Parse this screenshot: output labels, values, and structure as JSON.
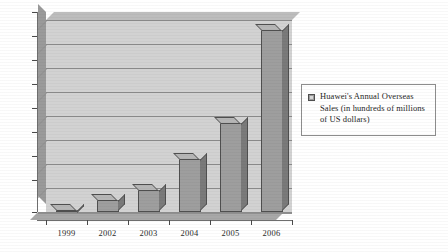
{
  "chart_data": {
    "type": "bar",
    "title": "",
    "xlabel": "",
    "ylabel": "",
    "categories": [
      "1999",
      "2002",
      "2003",
      "2004",
      "2005",
      "2006"
    ],
    "values": [
      1,
      5,
      9,
      22,
      37,
      76
    ],
    "ylim": [
      0,
      80
    ],
    "ytick_labels": [
      "0",
      "10",
      "20",
      "30",
      "40",
      "50",
      "60",
      "70",
      "80"
    ],
    "ytick_values": [
      0,
      10,
      20,
      30,
      40,
      50,
      60,
      70,
      80
    ],
    "grid": true,
    "legend_position": "right",
    "series": [
      {
        "name": "Huawei's Annual Overseas Sales (in hundreds of millions of US dollars)",
        "values": [
          1,
          5,
          9,
          22,
          37,
          76
        ]
      }
    ]
  },
  "legend": {
    "swatch_icon": "series-color-swatch-icon",
    "entries": [
      {
        "label": "Huawei's Annual Overseas Sales (in hundreds of millions of US dollars)"
      }
    ]
  },
  "colors": {
    "bar_front": "#9e9e9e",
    "bar_side": "#7a7a7a",
    "bar_top": "#b6b6b6",
    "bar_outline": "#4f4f4f",
    "plot_background": "#d2d2d2",
    "gridline": "#8d8d8d",
    "axis": "#6e6e6e",
    "text": "#2b2b2b",
    "page_background": "#ffffff"
  }
}
